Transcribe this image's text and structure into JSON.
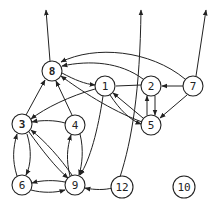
{
  "diagram": {
    "type": "directed-graph",
    "nodes": [
      {
        "id": "1",
        "label": "1",
        "x": 105,
        "y": 86
      },
      {
        "id": "2",
        "label": "2",
        "x": 151,
        "y": 86
      },
      {
        "id": "3",
        "label": "3",
        "x": 22,
        "y": 124
      },
      {
        "id": "4",
        "label": "4",
        "x": 75,
        "y": 125
      },
      {
        "id": "5",
        "label": "5",
        "x": 151,
        "y": 125
      },
      {
        "id": "6",
        "label": "6",
        "x": 22,
        "y": 185
      },
      {
        "id": "7",
        "label": "7",
        "x": 193,
        "y": 86
      },
      {
        "id": "8",
        "label": "8",
        "x": 52,
        "y": 71
      },
      {
        "id": "9",
        "label": "9",
        "x": 75,
        "y": 185
      },
      {
        "id": "10",
        "label": "10",
        "x": 184,
        "y": 187
      },
      {
        "id": "12",
        "label": "12",
        "x": 122,
        "y": 187
      }
    ],
    "edges": [
      {
        "from": "8",
        "to": "out-top-left"
      },
      {
        "from": "5",
        "to": "out-top-middle"
      },
      {
        "from": "7",
        "to": "out-top-right"
      },
      {
        "from": "7",
        "to": "8"
      },
      {
        "from": "7",
        "to": "2"
      },
      {
        "from": "7",
        "to": "5"
      },
      {
        "from": "2",
        "to": "8"
      },
      {
        "from": "2",
        "to": "5"
      },
      {
        "from": "5",
        "to": "2"
      },
      {
        "from": "2",
        "to": "1"
      },
      {
        "from": "5",
        "to": "1"
      },
      {
        "from": "5",
        "to": "8"
      },
      {
        "from": "1",
        "to": "5"
      },
      {
        "from": "8",
        "to": "1"
      },
      {
        "from": "1",
        "to": "8"
      },
      {
        "from": "1",
        "to": "3"
      },
      {
        "from": "1",
        "to": "9"
      },
      {
        "from": "4",
        "to": "8"
      },
      {
        "from": "4",
        "to": "3"
      },
      {
        "from": "4",
        "to": "9"
      },
      {
        "from": "9",
        "to": "4"
      },
      {
        "from": "3",
        "to": "8"
      },
      {
        "from": "3",
        "to": "6"
      },
      {
        "from": "6",
        "to": "3"
      },
      {
        "from": "3",
        "to": "9"
      },
      {
        "from": "9",
        "to": "3"
      },
      {
        "from": "9",
        "to": "6"
      },
      {
        "from": "6",
        "to": "9"
      },
      {
        "from": "12",
        "to": "9"
      },
      {
        "from": "12",
        "to": "out-top-middle"
      }
    ]
  }
}
